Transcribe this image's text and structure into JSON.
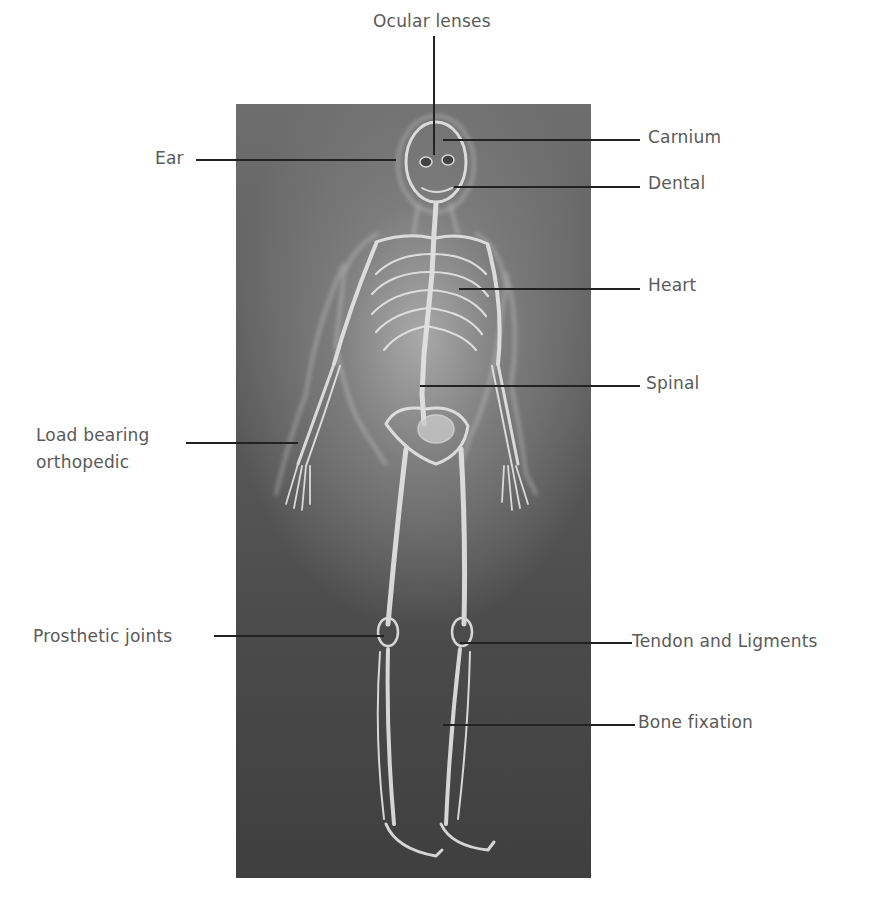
{
  "diagram": {
    "labels": {
      "ocular_lenses": "Ocular lenses",
      "carnium": "Carnium",
      "ear": "Ear",
      "dental": "Dental",
      "heart": "Heart",
      "spinal": "Spinal",
      "load_bearing_line1": "Load bearing",
      "load_bearing_line2": "orthopedic",
      "prosthetic_joints": "Prosthetic joints",
      "tendon_ligments": "Tendon and Ligments",
      "bone_fixation": "Bone fixation"
    },
    "colors": {
      "background": "#ffffff",
      "panel_dark": "#4a4a4a",
      "panel_light": "#a9a9a9",
      "bone": "#e8e8e8",
      "label_text": "#5a5a5a",
      "leader_line": "#222222"
    }
  }
}
